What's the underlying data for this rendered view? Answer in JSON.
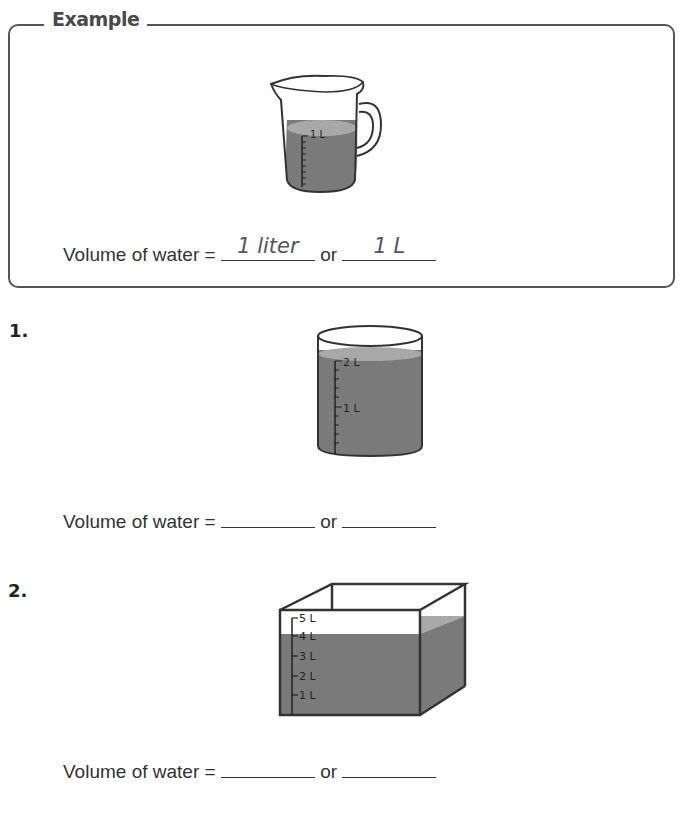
{
  "example": {
    "title": "Example",
    "pitcher_label": "1 L",
    "sentence": {
      "prefix": "Volume of water = ",
      "connector": " or ",
      "answer1": "1 liter",
      "answer2": "1 L"
    }
  },
  "problems": [
    {
      "number": "1.",
      "container": "cylinder",
      "scale_labels": [
        "2 L",
        "1 L"
      ],
      "sentence": {
        "prefix": "Volume of water = ",
        "connector": " or ",
        "answer1": "",
        "answer2": ""
      }
    },
    {
      "number": "2.",
      "container": "box",
      "scale_labels": [
        "5 L",
        "4 L",
        "3 L",
        "2 L",
        "1 L"
      ],
      "sentence": {
        "prefix": "Volume of water = ",
        "connector": " or ",
        "answer1": "",
        "answer2": ""
      }
    }
  ],
  "colors": {
    "water_dark": "#7a7a7a",
    "water_light": "#a8a8a8",
    "outline": "#333333"
  }
}
